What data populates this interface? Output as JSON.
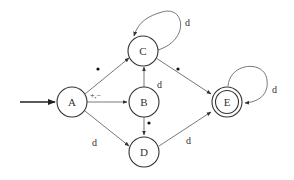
{
  "diagram": {
    "type": "finite-state-automaton",
    "states": [
      {
        "id": "A",
        "label": "A",
        "x": 72,
        "y": 102,
        "start": true,
        "accepting": false
      },
      {
        "id": "B",
        "label": "B",
        "x": 144,
        "y": 102,
        "start": false,
        "accepting": false
      },
      {
        "id": "C",
        "label": "C",
        "x": 143,
        "y": 50,
        "start": false,
        "accepting": false
      },
      {
        "id": "D",
        "label": "D",
        "x": 144,
        "y": 152,
        "start": false,
        "accepting": false
      },
      {
        "id": "E",
        "label": "E",
        "x": 227,
        "y": 102,
        "start": false,
        "accepting": true
      }
    ],
    "transitions": [
      {
        "from": "A",
        "to": "C",
        "label": "•"
      },
      {
        "from": "A",
        "to": "B",
        "label": "+,−"
      },
      {
        "from": "A",
        "to": "D",
        "label": "d"
      },
      {
        "from": "B",
        "to": "C",
        "label": "d"
      },
      {
        "from": "B",
        "to": "D",
        "label": "•"
      },
      {
        "from": "C",
        "to": "C",
        "label": "d"
      },
      {
        "from": "C",
        "to": "E",
        "label": "•"
      },
      {
        "from": "D",
        "to": "E",
        "label": "d"
      },
      {
        "from": "E",
        "to": "E",
        "label": "d"
      }
    ],
    "labels": {
      "A": "A",
      "B": "B",
      "C": "C",
      "D": "D",
      "E": "E",
      "a_to_b": "+,−",
      "a_to_d": "d",
      "b_to_c": "d",
      "c_loop": "d",
      "d_to_e": "d",
      "e_loop": "d"
    },
    "colors": {
      "stroke": "#333333",
      "edge": "#555555",
      "background": "#ffffff"
    }
  }
}
